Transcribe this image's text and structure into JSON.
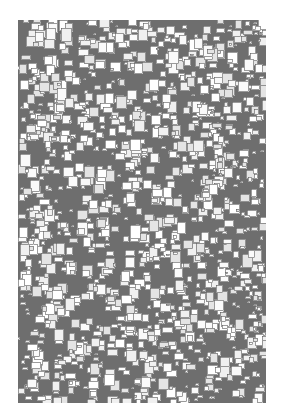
{
  "image": {
    "description": "Grey rectangle densely covered with overlapping white and light-grey squares",
    "panel": {
      "x": 18,
      "y": 20,
      "width": 248,
      "height": 383
    },
    "colors": {
      "page_background": "#ffffff",
      "panel_background": "#6e6e6e",
      "square_fill_light": "#fafafa",
      "square_fill_mid": "#e4e4e4",
      "square_border": "#5a5a5a"
    },
    "squares": {
      "count": 1400,
      "min_size": 3,
      "max_size": 11,
      "seed": 20240
    }
  }
}
